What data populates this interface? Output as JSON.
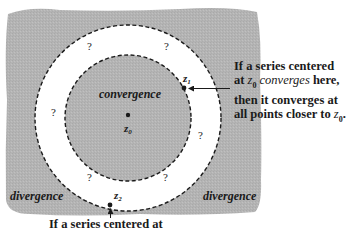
{
  "figure": {
    "colors": {
      "divergence_region": "#b3b3b3",
      "ring_region": "#ffffff",
      "convergence_region": "#b8b8b8",
      "ink": "#1a1a1a"
    },
    "regions": {
      "inner_label": "convergence",
      "outer_left_label": "divergence",
      "outer_right_label": "divergence",
      "unknown_marker": "?"
    },
    "points": {
      "center": {
        "label": "z",
        "sub": "0"
      },
      "p1": {
        "label": "z",
        "sub": "1"
      },
      "p2": {
        "label": "z",
        "sub": "2"
      }
    },
    "question_marks": [
      "?",
      "?",
      "?",
      "?",
      "?",
      "?"
    ],
    "notes": {
      "right": {
        "line1": "If a series centered",
        "line2_pre": "at ",
        "line2_var": "z",
        "line2_sub": "0",
        "line2_italic": " converges",
        "line2_post": " here,",
        "line3": "then it converges at",
        "line4_pre": "all points closer to ",
        "line4_var": "z",
        "line4_sub": "0",
        "line4_post": "."
      },
      "bottom": {
        "line1": "If a series centered at"
      }
    }
  }
}
